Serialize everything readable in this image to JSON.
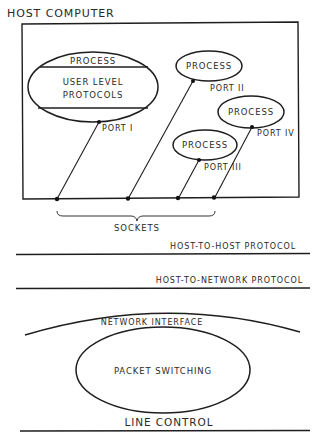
{
  "diagram": {
    "title": "HOST COMPUTER",
    "host": {
      "main_process": {
        "top_label": "PROCESS",
        "middle_label_line1": "USER LEVEL",
        "middle_label_line2": "PROTOCOLS",
        "port_label": "PORT I"
      },
      "processes": [
        {
          "label": "PROCESS",
          "port_label": "PORT II"
        },
        {
          "label": "PROCESS",
          "port_label": "PORT IV"
        },
        {
          "label": "PROCESS",
          "port_label": "PORT III"
        }
      ],
      "sockets_label": "SOCKETS"
    },
    "layers": [
      {
        "label": "HOST-TO-HOST PROTOCOL"
      },
      {
        "label": "HOST-TO-NETWORK PROTOCOL"
      }
    ],
    "network": {
      "interface_label": "NETWORK INTERFACE",
      "core_label": "PACKET SWITCHING",
      "line_control_label": "LINE CONTROL"
    },
    "colors": {
      "ink": "#1e1e1e",
      "background": "#ffffff"
    }
  }
}
